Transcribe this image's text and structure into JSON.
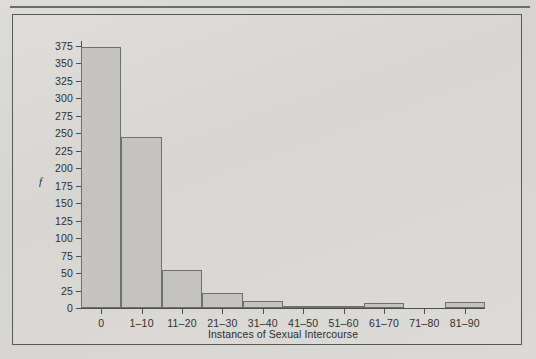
{
  "figure": {
    "y_axis_title": "f",
    "x_axis_title": "Instances of Sexual Intercourse"
  },
  "chart_data": {
    "type": "bar",
    "title": "",
    "subtitle": "",
    "xlabel": "Instances of Sexual Intercourse",
    "ylabel": "f",
    "categories": [
      "0",
      "1–10",
      "11–20",
      "21–30",
      "31–40",
      "41–50",
      "51–60",
      "61–70",
      "71–80",
      "81–90"
    ],
    "values": [
      373,
      245,
      55,
      22,
      10,
      2,
      2,
      7,
      0,
      8
    ],
    "ylim": [
      0,
      375
    ],
    "yticks": [
      0,
      25,
      50,
      75,
      100,
      125,
      150,
      175,
      200,
      225,
      250,
      275,
      300,
      325,
      350,
      375
    ],
    "ytick_labels": [
      "0",
      "25",
      "50",
      "75",
      "100",
      "125",
      "150",
      "175",
      "200",
      "225",
      "250",
      "275",
      "300",
      "325",
      "350",
      "375"
    ],
    "grid": false,
    "legend": null,
    "bar_fill_color": "#c5c3bf",
    "bar_edge_color": "#6f6f71",
    "background_color": "#d9d8d4",
    "axis_color": "#4d4d4f"
  }
}
